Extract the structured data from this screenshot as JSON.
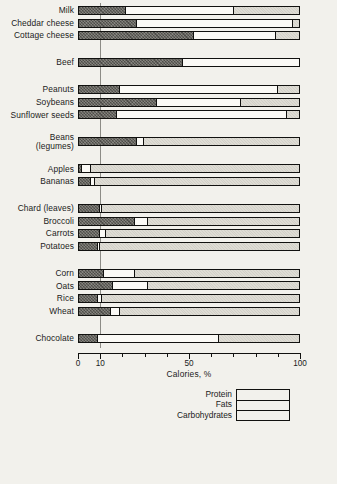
{
  "chart_data": {
    "type": "bar",
    "orientation": "horizontal",
    "stacked": true,
    "title": "",
    "xlabel": "Calories, %",
    "ylabel": "",
    "xlim": [
      0,
      100
    ],
    "xticks": [
      0,
      10,
      20,
      30,
      40,
      50,
      60,
      70,
      80,
      90,
      100
    ],
    "xticklabels": [
      "0",
      "10",
      "",
      "",
      "",
      "50",
      "",
      "",
      "",
      "",
      "100"
    ],
    "grid": false,
    "reference_line": 10,
    "legend_position": "bottom-right",
    "series": [
      {
        "name": "Protein",
        "key": "protein",
        "color": "#6e6d67",
        "pattern": "cross-hatch"
      },
      {
        "name": "Fats",
        "key": "fats",
        "color": "#fbfaf6",
        "pattern": "solid"
      },
      {
        "name": "Carbohydrates",
        "key": "carbs",
        "color": "#dedcd4",
        "pattern": "stipple"
      }
    ],
    "categories": [
      "Milk",
      "Cheddar cheese",
      "Cottage cheese",
      "Beef",
      "Peanuts",
      "Soybeans",
      "Sunflower seeds",
      "Beans (legumes)",
      "Apples",
      "Bananas",
      "Chard (leaves)",
      "Broccoli",
      "Carrots",
      "Potatoes",
      "Corn",
      "Oats",
      "Rice",
      "Wheat",
      "Chocolate"
    ],
    "groups": [
      {
        "name": "dairy",
        "items": [
          {
            "label": "Milk",
            "protein": 21,
            "fats": 49,
            "carbs": 30
          },
          {
            "label": "Cheddar cheese",
            "protein": 26,
            "fats": 71,
            "carbs": 3
          },
          {
            "label": "Cottage cheese",
            "protein": 52,
            "fats": 37,
            "carbs": 11
          }
        ]
      },
      {
        "name": "meat",
        "items": [
          {
            "label": "Beef",
            "protein": 47,
            "fats": 53,
            "carbs": 0
          }
        ]
      },
      {
        "name": "nuts-seeds",
        "items": [
          {
            "label": "Peanuts",
            "protein": 18,
            "fats": 72,
            "carbs": 10
          },
          {
            "label": "Soybeans",
            "protein": 35,
            "fats": 38,
            "carbs": 27
          },
          {
            "label": "Sunflower seeds",
            "protein": 17,
            "fats": 77,
            "carbs": 6
          }
        ]
      },
      {
        "name": "legumes",
        "items": [
          {
            "label": "Beans (legumes)",
            "protein": 26,
            "fats": 3,
            "carbs": 71
          }
        ]
      },
      {
        "name": "fruit",
        "items": [
          {
            "label": "Apples",
            "protein": 1,
            "fats": 4,
            "carbs": 95
          },
          {
            "label": "Bananas",
            "protein": 5,
            "fats": 2,
            "carbs": 93
          }
        ]
      },
      {
        "name": "vegetables",
        "items": [
          {
            "label": "Chard (leaves)",
            "protein": 9,
            "fats": 1,
            "carbs": 90
          },
          {
            "label": "Broccoli",
            "protein": 25,
            "fats": 6,
            "carbs": 69
          },
          {
            "label": "Carrots",
            "protein": 9,
            "fats": 3,
            "carbs": 88
          },
          {
            "label": "Potatoes",
            "protein": 8,
            "fats": 1,
            "carbs": 91
          }
        ]
      },
      {
        "name": "grains",
        "items": [
          {
            "label": "Corn",
            "protein": 11,
            "fats": 14,
            "carbs": 75
          },
          {
            "label": "Oats",
            "protein": 15,
            "fats": 16,
            "carbs": 69
          },
          {
            "label": "Rice",
            "protein": 8,
            "fats": 2,
            "carbs": 90
          },
          {
            "label": "Wheat",
            "protein": 14,
            "fats": 4,
            "carbs": 82
          }
        ]
      },
      {
        "name": "confection",
        "items": [
          {
            "label": "Chocolate",
            "protein": 8,
            "fats": 55,
            "carbs": 37
          }
        ]
      }
    ]
  },
  "axis": {
    "title": "Calories, %",
    "ticks": [
      {
        "value": 0,
        "label": "0"
      },
      {
        "value": 10,
        "label": "10"
      },
      {
        "value": 20,
        "label": ""
      },
      {
        "value": 30,
        "label": ""
      },
      {
        "value": 40,
        "label": ""
      },
      {
        "value": 50,
        "label": "50"
      },
      {
        "value": 60,
        "label": ""
      },
      {
        "value": 70,
        "label": ""
      },
      {
        "value": 80,
        "label": ""
      },
      {
        "value": 90,
        "label": ""
      },
      {
        "value": 100,
        "label": "100"
      }
    ]
  },
  "legend": {
    "entries": [
      {
        "label": "Protein",
        "key": "protein"
      },
      {
        "label": "Fats",
        "key": "fats"
      },
      {
        "label": "Carbohydrates",
        "key": "carbs"
      }
    ]
  }
}
